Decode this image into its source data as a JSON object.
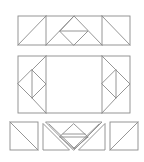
{
  "diagram": {
    "stroke_color": "#8a8a8a",
    "background": "#ffffff",
    "rows": [
      {
        "name": "top-row",
        "label": "Rectangle assembly of three panels",
        "outer": {
          "x": 18,
          "y": 16,
          "w": 112,
          "h": 29
        }
      },
      {
        "name": "middle-row",
        "label": "Rectangle assembly with side diamonds",
        "outer": {
          "x": 18,
          "y": 56,
          "w": 112,
          "h": 57
        }
      },
      {
        "name": "bottom-row",
        "label": "Exploded pieces",
        "pieces": [
          "square-left",
          "triangle-left",
          "inverted-triangle",
          "diamond-center",
          "triangle-right",
          "square-right"
        ]
      }
    ]
  }
}
